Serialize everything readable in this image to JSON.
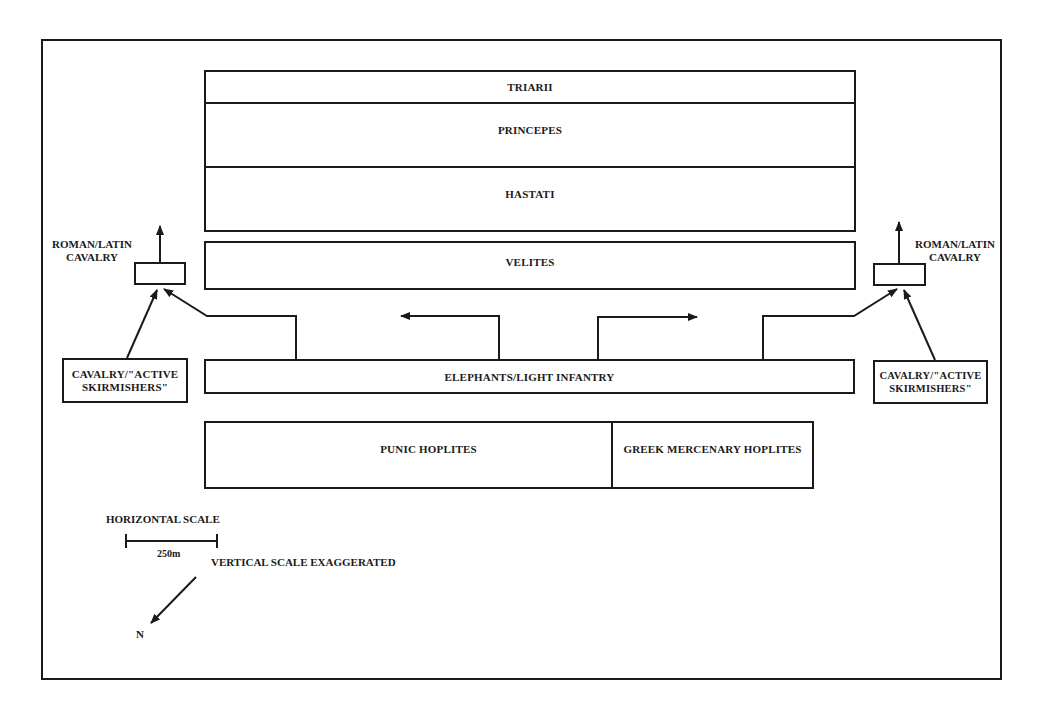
{
  "diagram": {
    "roman_line": {
      "triarii": "TRIARII",
      "principes": "PRINCEPES",
      "hastati": "HASTATI",
      "velites": "VELITES"
    },
    "roman_cavalry": {
      "left_label_1": "ROMAN/LATIN",
      "left_label_2": "CAVALRY",
      "right_label_1": "ROMAN/LATIN",
      "right_label_2": "CAVALRY"
    },
    "carthaginian_line": {
      "elephants": "ELEPHANTS/LIGHT INFANTRY",
      "punic_hoplites": "PUNIC HOPLITES",
      "greek_hoplites": "GREEK MERCENARY HOPLITES",
      "left_cavalry_1": "CAVALRY/\"ACTIVE",
      "left_cavalry_2": "SKIRMISHERS\"",
      "right_cavalry_1": "CAVALRY/\"ACTIVE",
      "right_cavalry_2": "SKIRMISHERS\""
    },
    "legend": {
      "horizontal_scale": "HORIZONTAL SCALE",
      "scale_value": "250m",
      "vertical_note": "VERTICAL SCALE EXAGGERATED",
      "north": "N"
    },
    "colors": {
      "ink": "#1a1a1a",
      "background": "#ffffff"
    }
  }
}
